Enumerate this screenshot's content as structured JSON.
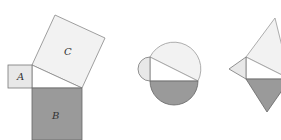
{
  "colors": {
    "light_fill": "#eeeeee",
    "lightest_fill": "#f2f2f2",
    "white_fill": "#ffffff",
    "dark_fill": "#9a9a9a",
    "stroke": "#777777"
  },
  "figures": [
    {
      "name": "squares",
      "labels": {
        "a": "A",
        "b": "B",
        "c": "C"
      }
    },
    {
      "name": "semicircles"
    },
    {
      "name": "triangles"
    }
  ]
}
